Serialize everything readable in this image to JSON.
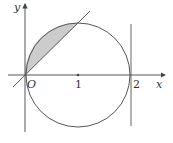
{
  "diagram": {
    "labels": {
      "y_axis": "y",
      "x_axis": "x",
      "origin": "O",
      "tick_1": "1",
      "tick_2": "2"
    },
    "colors": {
      "stroke": "#555555",
      "axis": "#444444",
      "shade": "#cccccc"
    }
  }
}
